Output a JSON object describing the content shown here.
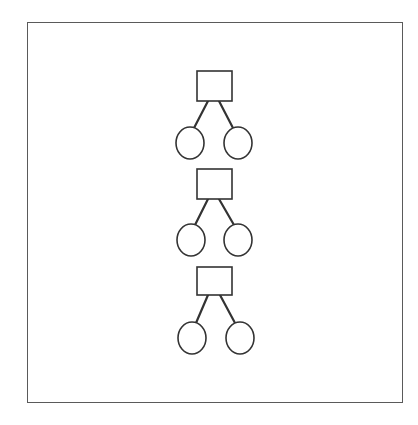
{
  "diagram": {
    "type": "pedigree-trees",
    "frame": {
      "x": 27,
      "y": 22,
      "width": 376,
      "height": 381,
      "stroke": "#5a5a5a"
    },
    "stroke_color": "#333333",
    "fill_color": "#ffffff",
    "node_shapes": {
      "square": "parent",
      "circle": "child"
    },
    "trees": [
      {
        "parent": {
          "shape": "square",
          "x": 197,
          "y": 71,
          "w": 35,
          "h": 30
        },
        "children": [
          {
            "shape": "circle",
            "cx": 190,
            "cy": 143,
            "rx": 14,
            "ry": 16
          },
          {
            "shape": "circle",
            "cx": 238,
            "cy": 143,
            "rx": 14,
            "ry": 16
          }
        ],
        "edges": [
          {
            "x1": 208,
            "y1": 101,
            "x2": 194,
            "y2": 128
          },
          {
            "x1": 219,
            "y1": 101,
            "x2": 233,
            "y2": 128
          }
        ]
      },
      {
        "parent": {
          "shape": "square",
          "x": 197,
          "y": 169,
          "w": 35,
          "h": 30
        },
        "children": [
          {
            "shape": "circle",
            "cx": 191,
            "cy": 240,
            "rx": 14,
            "ry": 16
          },
          {
            "shape": "circle",
            "cx": 238,
            "cy": 240,
            "rx": 14,
            "ry": 16
          }
        ],
        "edges": [
          {
            "x1": 208,
            "y1": 199,
            "x2": 195,
            "y2": 225
          },
          {
            "x1": 219,
            "y1": 199,
            "x2": 234,
            "y2": 225
          }
        ]
      },
      {
        "parent": {
          "shape": "square",
          "x": 197,
          "y": 267,
          "w": 35,
          "h": 28
        },
        "children": [
          {
            "shape": "circle",
            "cx": 192,
            "cy": 338,
            "rx": 14,
            "ry": 16
          },
          {
            "shape": "circle",
            "cx": 240,
            "cy": 338,
            "rx": 14,
            "ry": 16
          }
        ],
        "edges": [
          {
            "x1": 208,
            "y1": 295,
            "x2": 196,
            "y2": 323
          },
          {
            "x1": 220,
            "y1": 295,
            "x2": 235,
            "y2": 323
          }
        ]
      }
    ]
  }
}
